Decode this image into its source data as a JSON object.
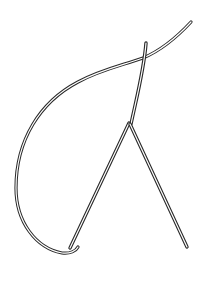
{
  "figure": {
    "colors": {
      "stroke": "#2a2a2a",
      "background": "#ffffff"
    },
    "elements": [
      {
        "name": "thread-curve"
      },
      {
        "name": "needle-shaft"
      },
      {
        "name": "left-leg"
      },
      {
        "name": "right-leg"
      }
    ]
  }
}
